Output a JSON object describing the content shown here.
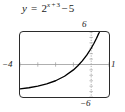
{
  "figure": {
    "equation": {
      "lhs": "y",
      "equals": "=",
      "base": "2",
      "exponent_var": "x",
      "exponent_op": "+",
      "exponent_const": "3",
      "minus": "−",
      "constant": "5",
      "plain": "y = 2^(x+3) − 5"
    },
    "colors": {
      "curve": "#000000",
      "axis": "#9a9a9a",
      "frame": "#2b2b2b",
      "text": "#1a1a1a",
      "background": "#ffffff"
    }
  },
  "chart_data": {
    "type": "line",
    "xlabel": "",
    "ylabel": "",
    "xlim": [
      -4,
      1
    ],
    "ylim": [
      -6,
      6
    ],
    "grid": false,
    "legend": null,
    "axis_tick_labels": {
      "x_left": "−4",
      "x_right": "1",
      "y_top": "6",
      "y_bottom": "−6"
    },
    "x_ticks": [
      -4,
      -3,
      -2,
      -1,
      0,
      1
    ],
    "y_ticks": [
      -6,
      -4,
      -2,
      0,
      2,
      4,
      6
    ],
    "series": [
      {
        "name": "y = 2^(x+3) − 5",
        "x": [
          -4,
          -3.5,
          -3,
          -2.5,
          -2,
          -1.5,
          -1,
          -0.75,
          -0.5,
          -0.25,
          0,
          0.15,
          0.3,
          0.45,
          0.6
        ],
        "y": [
          -4.5,
          -4.29,
          -4.0,
          -3.59,
          -3.0,
          -2.17,
          -1.0,
          -0.24,
          0.66,
          1.73,
          3.0,
          3.88,
          4.85,
          5.93,
          7.13
        ]
      }
    ],
    "x_intercept": -0.678,
    "y_intercept": 3,
    "asymptote": -5
  }
}
